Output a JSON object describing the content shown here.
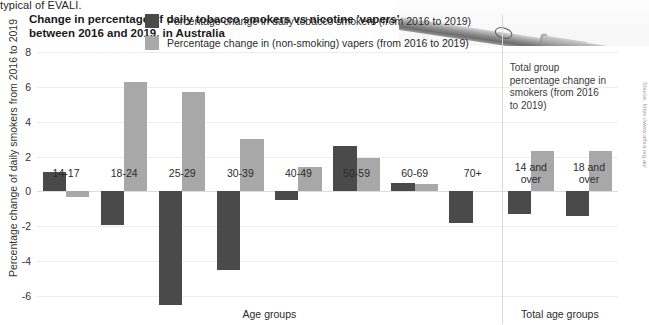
{
  "article_snippet": "typical of EVALI.",
  "photo": {
    "alt": "vape-device-photo"
  },
  "chart_data": {
    "type": "bar",
    "title": "Change in percentage of daily tobacco smokers vs nicotine 'vapers' between 2016 and 2019, in Australia",
    "title_line1": "Change in percentage of daily tobacco smokers vs nicotine 'vapers'",
    "title_line2": "between 2016 and 2019, in Australia",
    "ylabel": "Percentage change of daily smokers from 2016 to 2019",
    "xlabel": "Age groups",
    "xlabel_secondary": "Total age groups",
    "ylim": [
      -6,
      8
    ],
    "yticks": [
      8,
      6,
      4,
      2,
      0,
      -2,
      -4,
      -6
    ],
    "ytick_labels": [
      "8",
      "6",
      "4",
      "2",
      "0",
      "-2",
      "-4",
      "-6"
    ],
    "grid": true,
    "legend_position": "top-center",
    "categories": [
      "14-17",
      "18-24",
      "25-29",
      "30-39",
      "40-49",
      "50-59",
      "60-69",
      "70+",
      "14 and over",
      "18 and over"
    ],
    "category_labels": [
      [
        "14-17"
      ],
      [
        "18-24"
      ],
      [
        "25-29"
      ],
      [
        "30-39"
      ],
      [
        "40-49"
      ],
      [
        "50-59"
      ],
      [
        "60-69"
      ],
      [
        "70+"
      ],
      [
        "14 and",
        "over"
      ],
      [
        "18 and",
        "over"
      ]
    ],
    "series": [
      {
        "name": "Percentage change in daily tobacco smokers (from 2016 to 2019)",
        "color": "#4a4a4a",
        "values": [
          1.1,
          -1.9,
          -6.5,
          -4.5,
          -0.5,
          2.6,
          0.5,
          -1.8,
          -1.3,
          -1.4
        ]
      },
      {
        "name": "Percentage change in (non-smoking) vapers (from 2016 to 2019)",
        "color": "#a8a8a8",
        "values": [
          -0.3,
          6.3,
          5.7,
          3.0,
          1.4,
          1.9,
          0.4,
          0,
          2.3,
          2.3
        ]
      }
    ],
    "annotation": "Total group percentage change in smokers (from 2016 to 2019)",
    "annotation_lines": [
      "Total group",
      "percentage change in",
      "smokers (from 2016",
      "to 2019)"
    ],
    "divider_after_category_index": 7
  },
  "source": "Source: https://www.athra.org.au/"
}
